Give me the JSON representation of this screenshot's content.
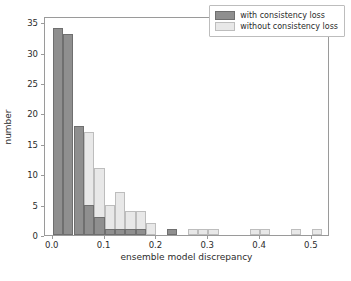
{
  "chart_data": {
    "type": "bar",
    "title": "",
    "xlabel": "ensemble model discrepancy",
    "ylabel": "number",
    "xlim": [
      -0.015,
      0.535
    ],
    "ylim": [
      0,
      36
    ],
    "xticks": [
      "0.0",
      "0.1",
      "0.2",
      "0.3",
      "0.4",
      "0.5"
    ],
    "xtick_values": [
      0.0,
      0.1,
      0.2,
      0.3,
      0.4,
      0.5
    ],
    "yticks": [
      "0",
      "5",
      "10",
      "15",
      "20",
      "25",
      "30",
      "35"
    ],
    "ytick_values": [
      0,
      5,
      10,
      15,
      20,
      25,
      30,
      35
    ],
    "grid": false,
    "legend_position": "upper right",
    "bin_width": 0.02,
    "bin_edges": [
      0.0,
      0.02,
      0.04,
      0.06,
      0.08,
      0.1,
      0.12,
      0.14,
      0.16,
      0.18,
      0.2,
      0.22,
      0.24,
      0.26,
      0.28,
      0.3,
      0.32,
      0.34,
      0.36,
      0.38,
      0.4,
      0.42,
      0.44,
      0.46,
      0.48,
      0.5,
      0.52
    ],
    "series": [
      {
        "name": "with consistency loss",
        "color": "#8f8f8f",
        "edge_color": "#6f6f6f",
        "bin_starts": [
          0.0,
          0.02,
          0.04,
          0.06,
          0.08,
          0.1,
          0.12,
          0.14,
          0.16,
          0.22
        ],
        "values": [
          34,
          33,
          18,
          5,
          3,
          1,
          1,
          1,
          1,
          1
        ]
      },
      {
        "name": "without consistency loss",
        "color": "#e8e8e8",
        "edge_color": "#bdbdbd",
        "bin_starts": [
          0.02,
          0.04,
          0.06,
          0.08,
          0.1,
          0.12,
          0.14,
          0.16,
          0.18,
          0.22,
          0.26,
          0.28,
          0.3,
          0.38,
          0.4,
          0.46,
          0.5
        ],
        "values": [
          11,
          12,
          17,
          11,
          5,
          7,
          4,
          4,
          2,
          1,
          1,
          1,
          1,
          1,
          1,
          1,
          1
        ]
      }
    ]
  },
  "legend": {
    "items": [
      {
        "label": "with consistency loss",
        "style": "dark"
      },
      {
        "label": "without consistency loss",
        "style": "light"
      }
    ]
  },
  "axes": {
    "x_title": "ensemble model discrepancy",
    "y_title": "number"
  },
  "colors": {
    "dark_fill": "#8f8f8f",
    "dark_edge": "#6f6f6f",
    "light_fill": "#e8e8e8",
    "light_edge": "#bdbdbd",
    "axis": "#9a9a9a",
    "text": "#2b2b2b",
    "background": "#ffffff"
  }
}
